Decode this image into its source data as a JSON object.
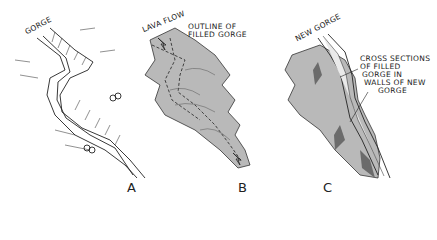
{
  "panels": [
    {
      "id": "A",
      "letter": "A",
      "labels": [
        "GORGE"
      ]
    },
    {
      "id": "B",
      "letter": "B",
      "labels": [
        "LAVA FLOW",
        "OUTLINE OF",
        "FILLED GORGE"
      ]
    },
    {
      "id": "C",
      "letter": "C",
      "labels": [
        "NEW GORGE",
        "CROSS SECTIONS",
        "OF FILLED",
        "GORGE IN",
        "WALLS OF NEW",
        "GORGE"
      ]
    }
  ],
  "colors": {
    "lava_fill": "#b9b9b9",
    "dark_section": "#6b6b6b",
    "line": "#222222"
  }
}
